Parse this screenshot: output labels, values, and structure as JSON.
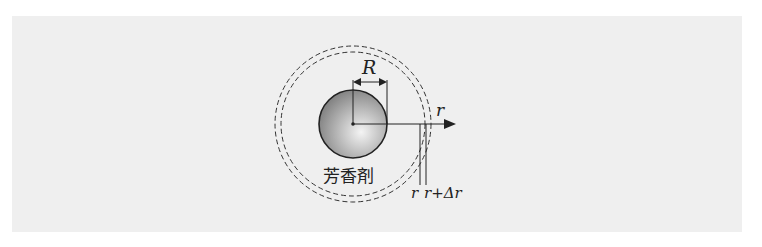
{
  "diagram": {
    "labels": {
      "radius_R": "R",
      "axis_r": "r",
      "shell_inner": "r",
      "shell_outer": "r+Δr",
      "substance": "芳香剤"
    },
    "colors": {
      "background": "#efefef",
      "line": "#222222",
      "sphere_light": "#f4f4f4",
      "sphere_dark": "#7a7a7a"
    }
  }
}
